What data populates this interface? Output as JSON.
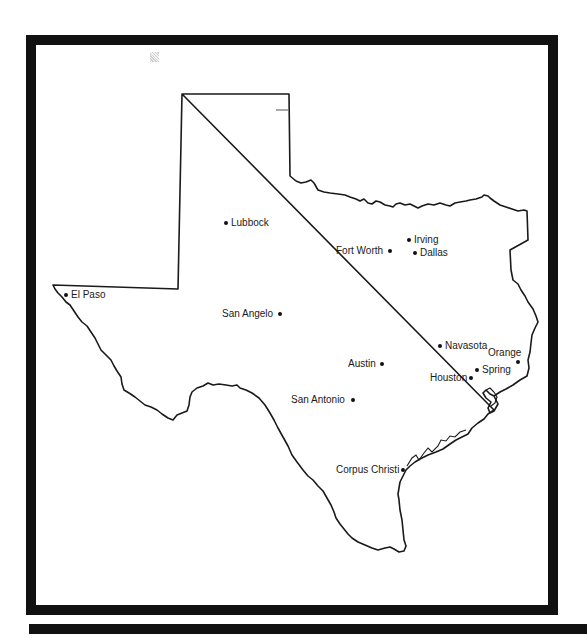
{
  "map": {
    "region": "Texas",
    "cities": [
      {
        "name": "Lubbock",
        "label": "Lubbock",
        "dot": [
          226,
          223
        ],
        "label_pos": [
          231,
          217
        ],
        "align": "left"
      },
      {
        "name": "Irving",
        "label": "Irving",
        "dot": [
          409,
          240
        ],
        "label_pos": [
          414,
          234
        ],
        "align": "left"
      },
      {
        "name": "Fort Worth",
        "label": "Fort Worth",
        "dot": [
          390,
          251
        ],
        "label_pos": [
          336,
          245
        ],
        "align": "right"
      },
      {
        "name": "Dallas",
        "label": "Dallas",
        "dot": [
          415,
          253
        ],
        "label_pos": [
          420,
          247
        ],
        "align": "left"
      },
      {
        "name": "El Paso",
        "label": "El Paso",
        "dot": [
          66,
          295
        ],
        "label_pos": [
          71,
          289
        ],
        "align": "left"
      },
      {
        "name": "San Angelo",
        "label": "San Angelo",
        "dot": [
          280,
          314
        ],
        "label_pos": [
          222,
          308
        ],
        "align": "right"
      },
      {
        "name": "Navasota",
        "label": "Navasota",
        "dot": [
          440,
          346
        ],
        "label_pos": [
          445,
          340
        ],
        "align": "left"
      },
      {
        "name": "Orange",
        "label": "Orange",
        "dot": [
          518,
          362
        ],
        "label_pos": [
          488,
          347
        ],
        "align": "left"
      },
      {
        "name": "Austin",
        "label": "Austin",
        "dot": [
          382,
          364
        ],
        "label_pos": [
          348,
          358
        ],
        "align": "right"
      },
      {
        "name": "Spring",
        "label": "Spring",
        "dot": [
          477,
          370
        ],
        "label_pos": [
          482,
          364
        ],
        "align": "left"
      },
      {
        "name": "Houston",
        "label": "Houston",
        "dot": [
          471,
          378
        ],
        "label_pos": [
          430,
          372
        ],
        "align": "right"
      },
      {
        "name": "San Antonio",
        "label": "San Antonio",
        "dot": [
          353,
          400
        ],
        "label_pos": [
          291,
          394
        ],
        "align": "right"
      },
      {
        "name": "Corpus Christi",
        "label": "Corpus Christi",
        "dot": [
          403,
          470
        ],
        "label_pos": [
          336,
          464
        ],
        "align": "right"
      }
    ],
    "colors": {
      "border": "#111111",
      "background": "#ffffff",
      "outline": "#1a1a1a"
    }
  }
}
